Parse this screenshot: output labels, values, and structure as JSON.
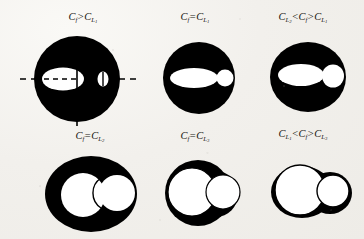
{
  "figure": {
    "title": "",
    "background_color": "#f2f0ec",
    "ink_color": "#000000",
    "void_color": "#ffffff",
    "panel_count": 6
  },
  "panels": [
    {
      "id": "panel-1",
      "position": "top-left",
      "caption_parts": {
        "lhs_symbol": "C",
        "lhs_sub": "f",
        "relation": ">",
        "rhs_symbol": "C",
        "rhs_sub": "L",
        "rhs_subsub": "1"
      },
      "caption_text": "Cf > CL1",
      "shape": "large-black-disk-with-split-white-ellipse-and-small-white-ellipse",
      "has_axis_lines": true,
      "axis_style": "dashed-horizontal-and-solid-vertical"
    },
    {
      "id": "panel-2",
      "position": "top-center",
      "caption_parts": {
        "lhs_symbol": "C",
        "lhs_sub": "f",
        "relation": "=",
        "rhs_symbol": "C",
        "rhs_sub": "L",
        "rhs_subsub": "1"
      },
      "caption_text": "Cf = CL1",
      "shape": "black-disk-with-white-ellipse-and-small-tangent-white-circle",
      "has_axis_lines": false,
      "axis_style": "none"
    },
    {
      "id": "panel-3",
      "position": "top-right",
      "caption_parts": {
        "lhs_symbol": "C",
        "lhs_sub": "L",
        "lhs_subsub": "2",
        "relation": "<",
        "mid_symbol": "C",
        "mid_sub": "f",
        "relation2": ">",
        "rhs_symbol": "C",
        "rhs_sub": "L",
        "rhs_subsub": "1"
      },
      "caption_text": "CL2 < Cf > CL1",
      "shape": "black-disk-with-white-ellipse-and-medium-white-circle",
      "has_axis_lines": false,
      "axis_style": "none"
    },
    {
      "id": "panel-4",
      "position": "bottom-left",
      "caption_parts": {
        "lhs_symbol": "C",
        "lhs_sub": "f",
        "relation": "=",
        "rhs_symbol": "C",
        "rhs_sub": "L",
        "rhs_subsub": "2"
      },
      "caption_text": "Cf = CL2",
      "shape": "black-ellipse-with-two-overlapping-white-circles",
      "has_axis_lines": false,
      "axis_style": "none"
    },
    {
      "id": "panel-5",
      "position": "bottom-center",
      "caption_parts": {
        "lhs_symbol": "C",
        "lhs_sub": "f",
        "relation": "=",
        "rhs_symbol": "C",
        "rhs_sub": "L",
        "rhs_subsub": "3"
      },
      "caption_text": "Cf = CL3",
      "shape": "black-blob-with-two-large-overlapping-white-circles",
      "has_axis_lines": false,
      "axis_style": "none"
    },
    {
      "id": "panel-6",
      "position": "bottom-right",
      "caption_parts": {
        "lhs_symbol": "C",
        "lhs_sub": "L",
        "lhs_subsub": "1",
        "relation": "<",
        "mid_symbol": "C",
        "mid_sub": "f",
        "relation2": ">",
        "rhs_symbol": "C",
        "rhs_sub": "L",
        "rhs_subsub": "3"
      },
      "caption_text": "CL1 < Cf > CL3",
      "shape": "thin-black-outline-with-two-large-overlapping-white-circles",
      "has_axis_lines": false,
      "axis_style": "none"
    }
  ]
}
